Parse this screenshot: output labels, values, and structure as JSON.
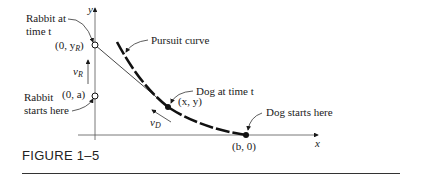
{
  "figure": {
    "caption": "FIGURE 1–5",
    "labels": {
      "rabbit_at_time_line1": "Rabbit at",
      "rabbit_at_time_line2": "time t",
      "rabbit_starts_line1": "Rabbit",
      "rabbit_starts_line2": "starts here",
      "pursuit_curve": "Pursuit curve",
      "dog_at_time": "Dog at time t",
      "dog_starts": "Dog starts here",
      "point_rabbit_t": "(0, y",
      "point_rabbit_t_sub": "R",
      "point_rabbit_start": "(0, a)",
      "point_dog": "(x, y)",
      "point_dog_start": "(b, 0)",
      "velocity_rabbit": "v",
      "velocity_rabbit_sub": "R",
      "velocity_dog": "v",
      "velocity_dog_sub": "D",
      "axis_x": "x",
      "axis_y": "y"
    }
  }
}
